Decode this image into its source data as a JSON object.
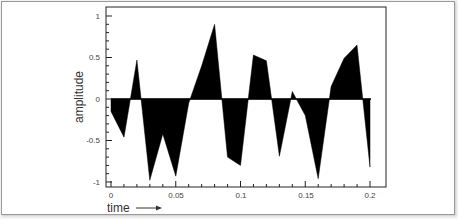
{
  "chart_data": {
    "type": "area",
    "title": "",
    "xlabel": "time",
    "ylabel": "amplitude",
    "xlim": [
      0,
      0.2
    ],
    "ylim": [
      -1,
      1
    ],
    "xticks": [
      0,
      0.05,
      0.1,
      0.15,
      0.2
    ],
    "xtick_labels": [
      "0",
      "0.05",
      "0.1",
      "0.15",
      "0.2"
    ],
    "yticks": [
      1,
      0.5,
      0,
      -0.5,
      -1
    ],
    "ytick_labels": [
      "1",
      "0.5",
      "0",
      "-0.5",
      "-1"
    ],
    "grid": false,
    "legend": null,
    "fill_color": "#000000",
    "x": [
      0,
      0.01,
      0.02,
      0.03,
      0.04,
      0.05,
      0.06,
      0.07,
      0.08,
      0.09,
      0.1,
      0.11,
      0.12,
      0.13,
      0.14,
      0.15,
      0.16,
      0.17,
      0.18,
      0.19,
      0.2
    ],
    "series": [
      {
        "name": "signal",
        "values": [
          -0.15,
          -0.46,
          0.47,
          -0.98,
          -0.42,
          -0.93,
          -0.05,
          0.4,
          0.9,
          -0.7,
          -0.8,
          0.53,
          0.46,
          -0.69,
          0.09,
          -0.2,
          -0.96,
          0.15,
          0.49,
          0.65,
          -0.82
        ]
      }
    ],
    "annotations": [
      "time →"
    ]
  },
  "labels": {
    "xlabel": "time",
    "ylabel": "amplitude",
    "x0": "0",
    "x1": "0.05",
    "x2": "0.1",
    "x3": "0.15",
    "x4": "0.2",
    "y0": "1",
    "y1": "0.5",
    "y2": "0",
    "y3": "-0.5",
    "y4": "-1"
  }
}
